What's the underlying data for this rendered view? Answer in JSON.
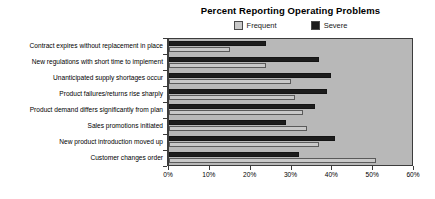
{
  "chart_data": {
    "type": "bar",
    "orientation": "horizontal",
    "title": "Percent Reporting Operating Problems",
    "xlabel": "",
    "ylabel": "",
    "xlim": [
      0,
      60
    ],
    "xticks": [
      "0%",
      "10%",
      "20%",
      "30%",
      "40%",
      "50%",
      "60%"
    ],
    "xtick_values": [
      0,
      10,
      20,
      30,
      40,
      50,
      60
    ],
    "grid": false,
    "legend_position": "top-center",
    "categories": [
      "Contract expires without replacement in place",
      "New regulations with short time to implement",
      "Unanticipated supply shortages occur",
      "Product failures/returns rise sharply",
      "Product demand differs significantly from plan",
      "Sales promotions initiated",
      "New product introduction moved up",
      "Customer changes order"
    ],
    "series": [
      {
        "name": "Severe",
        "color": "#1c1c1c",
        "values": [
          24,
          37,
          40,
          39,
          36,
          29,
          41,
          32
        ]
      },
      {
        "name": "Frequent",
        "color": "#c8c8c8",
        "values": [
          15,
          24,
          30,
          31,
          33,
          34,
          37,
          51
        ]
      }
    ],
    "plot_background": "#b8b8b8",
    "border_color": "#3c3c3c"
  },
  "legend": {
    "items": [
      {
        "label": "Frequent",
        "color": "#c8c8c8"
      },
      {
        "label": "Severe",
        "color": "#1c1c1c"
      }
    ]
  }
}
